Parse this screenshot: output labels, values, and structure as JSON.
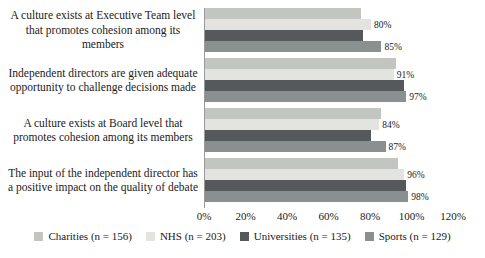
{
  "chart_data": {
    "type": "bar",
    "orientation": "horizontal",
    "title": "",
    "xlabel": "",
    "ylabel": "",
    "xlim": [
      0,
      120
    ],
    "x_ticks": [
      "0%",
      "20%",
      "40%",
      "60%",
      "80%",
      "100%",
      "120%"
    ],
    "grid": false,
    "legend_position": "bottom",
    "categories": [
      "A culture exists at Executive Team level that promotes cohesion among its members",
      "Independent directors are given adequate opportunity to challenge decisions made",
      "A culture exists at Board level that promotes cohesion among its members",
      "The input of the independent director has a positive impact on the quality of debate"
    ],
    "series": [
      {
        "name": "Charities (n = 156)",
        "color": "#c3c5c1",
        "values": [
          75,
          92,
          85,
          93
        ],
        "data_labels": [
          "",
          "",
          "",
          ""
        ]
      },
      {
        "name": "NHS (n = 203)",
        "color": "#e3e4e0",
        "values": [
          80,
          91,
          84,
          96
        ],
        "data_labels": [
          "80%",
          "91%",
          "84%",
          "96%"
        ]
      },
      {
        "name": "Universities (n = 135)",
        "color": "#55595b",
        "values": [
          76,
          96,
          80,
          97
        ],
        "data_labels": [
          "",
          "",
          "",
          ""
        ]
      },
      {
        "name": "Sports (n = 129)",
        "color": "#8a8f90",
        "values": [
          85,
          97,
          87,
          98
        ],
        "data_labels": [
          "85%",
          "97%",
          "87%",
          "98%"
        ]
      }
    ]
  }
}
